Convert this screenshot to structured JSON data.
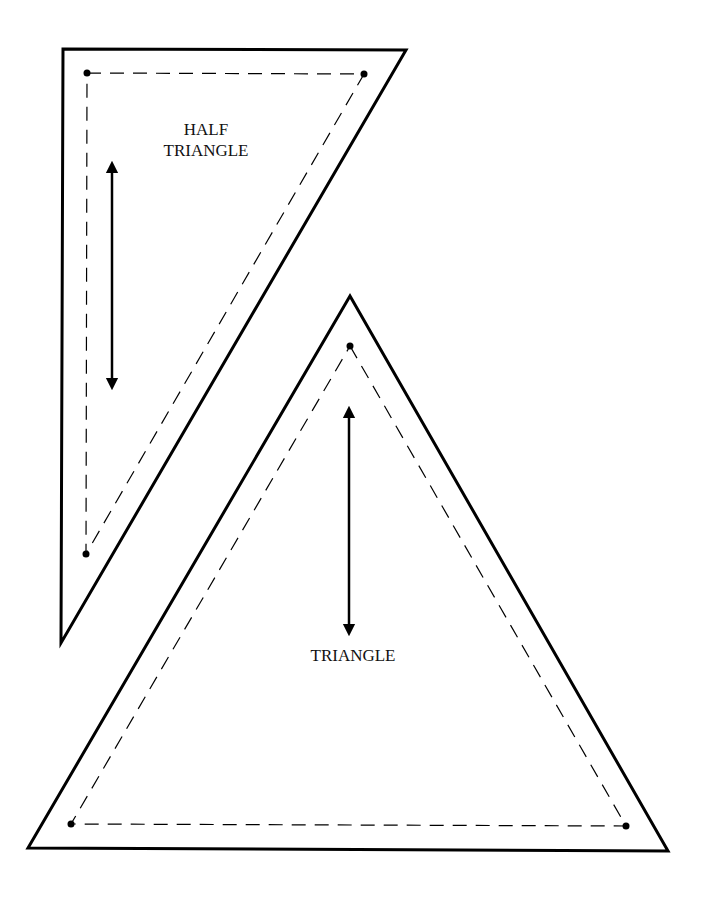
{
  "pieces": [
    {
      "id": "half-triangle",
      "label_lines": [
        "HALF",
        "TRIANGLE"
      ]
    },
    {
      "id": "triangle",
      "label_lines": [
        "TRIANGLE"
      ]
    }
  ],
  "colors": {
    "line": "#000000",
    "background": "#ffffff"
  }
}
